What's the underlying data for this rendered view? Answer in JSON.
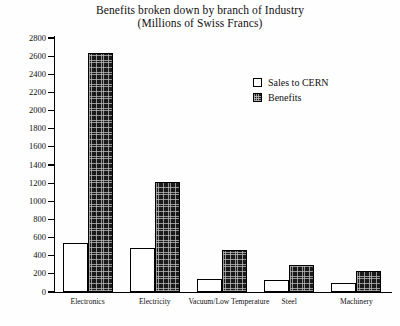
{
  "chart_data": {
    "type": "bar",
    "title": "Benefits broken down by branch of Industry",
    "subtitle": "(Millions of Swiss Francs)",
    "title_lines": [
      "Benefits broken down by branch of Industry",
      "(Millions of Swiss Francs)"
    ],
    "xlabel": "",
    "ylabel": "",
    "ylim": [
      0,
      2800
    ],
    "ytick_step": 200,
    "yticks": [
      0,
      200,
      400,
      600,
      800,
      1000,
      1200,
      1400,
      1600,
      1800,
      2000,
      2200,
      2400,
      2600,
      2800
    ],
    "ytick_labels": [
      "0",
      "200",
      "400",
      "600",
      "800",
      "1000",
      "1200",
      "1400",
      "1600",
      "1800",
      "2000",
      "2200",
      "2400",
      "2600",
      "2800"
    ],
    "grid": false,
    "legend_position": "upper right inside",
    "categories": [
      "Electronics",
      "Electricity",
      "Vacuum/Low Temperature",
      "Steel",
      "Machinery"
    ],
    "series": [
      {
        "name": "Sales to CERN",
        "fill": "white",
        "color": "#ffffff",
        "edge_color": "#000000",
        "values": [
          540,
          490,
          140,
          130,
          100
        ]
      },
      {
        "name": "Benefits",
        "fill": "dark-crosshatch",
        "color": "#1a1a1a",
        "edge_color": "#000000",
        "values": [
          2630,
          1210,
          465,
          300,
          235
        ]
      }
    ]
  },
  "legend": {
    "items": [
      {
        "label": "Sales to CERN",
        "swatch": "white-square"
      },
      {
        "label": "Benefits",
        "swatch": "dark-hatched-square"
      }
    ]
  }
}
